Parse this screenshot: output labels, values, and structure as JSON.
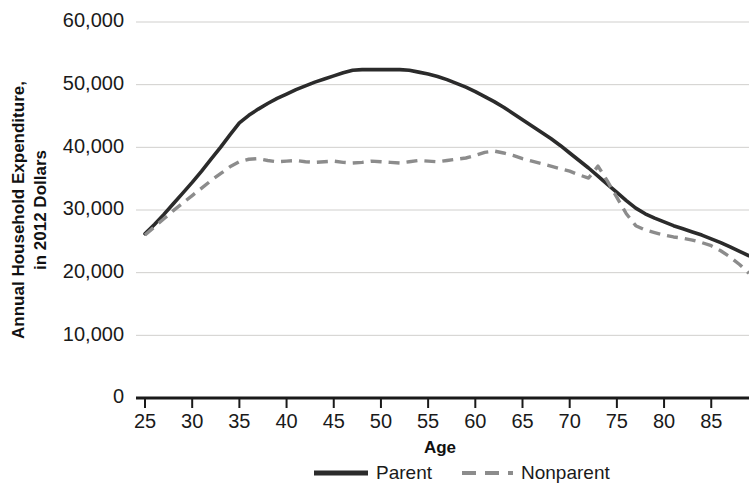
{
  "chart_data": {
    "type": "line",
    "title": "",
    "xlabel": "Age",
    "ylabel": "Annual Household Expenditure, in 2012 Dollars",
    "xlim": [
      25,
      89
    ],
    "ylim": [
      0,
      62000
    ],
    "grid": true,
    "legend_position": "bottom",
    "xticks": [
      25,
      30,
      35,
      40,
      45,
      50,
      55,
      60,
      65,
      70,
      75,
      80,
      85
    ],
    "xtick_labels": [
      "25",
      "30",
      "35",
      "40",
      "45",
      "50",
      "55",
      "60",
      "65",
      "70",
      "75",
      "80",
      "85"
    ],
    "yticks": [
      0,
      10000,
      20000,
      30000,
      40000,
      50000,
      60000
    ],
    "ytick_labels": [
      "0",
      "10,000",
      "20,000",
      "30,000",
      "40,000",
      "50,000",
      "60,000"
    ],
    "x": [
      25,
      26,
      27,
      28,
      29,
      30,
      31,
      32,
      33,
      34,
      35,
      36,
      37,
      38,
      39,
      40,
      41,
      42,
      43,
      44,
      45,
      46,
      47,
      48,
      49,
      50,
      51,
      52,
      53,
      54,
      55,
      56,
      57,
      58,
      59,
      60,
      61,
      62,
      63,
      64,
      65,
      66,
      67,
      68,
      69,
      70,
      71,
      72,
      73,
      74,
      75,
      76,
      77,
      78,
      79,
      80,
      81,
      82,
      83,
      84,
      85,
      86,
      87,
      88,
      89
    ],
    "series": [
      {
        "name": "Parent",
        "color": "#2b2b2b",
        "style": "solid",
        "values": [
          26200,
          27700,
          29300,
          31000,
          32700,
          34400,
          36200,
          38100,
          40000,
          42000,
          43900,
          45100,
          46100,
          47000,
          47800,
          48500,
          49200,
          49800,
          50400,
          50900,
          51400,
          51900,
          52300,
          52400,
          52400,
          52400,
          52400,
          52400,
          52300,
          52000,
          51700,
          51300,
          50800,
          50200,
          49600,
          48900,
          48100,
          47300,
          46400,
          45400,
          44400,
          43400,
          42400,
          41400,
          40300,
          39100,
          37900,
          36700,
          35400,
          34100,
          32800,
          31500,
          30300,
          29400,
          28700,
          28100,
          27500,
          27000,
          26500,
          26000,
          25400,
          24800,
          24100,
          23400,
          22700
        ]
      },
      {
        "name": "Nonparent",
        "color": "#8c8c8c",
        "style": "dashed",
        "values": [
          26000,
          27300,
          28600,
          29900,
          31100,
          32300,
          33500,
          34700,
          35800,
          36900,
          37700,
          38100,
          38200,
          37900,
          37700,
          37800,
          37900,
          37700,
          37600,
          37700,
          37800,
          37600,
          37500,
          37600,
          37800,
          37700,
          37600,
          37500,
          37700,
          37900,
          37800,
          37700,
          37900,
          38100,
          38300,
          38700,
          39200,
          39400,
          39100,
          38700,
          38200,
          37800,
          37400,
          37000,
          36600,
          36200,
          35600,
          35100,
          37000,
          34600,
          32000,
          29400,
          27500,
          26800,
          26400,
          26000,
          25700,
          25500,
          25200,
          24800,
          24300,
          23500,
          22500,
          21300,
          19900
        ]
      }
    ]
  },
  "axis_titles": {
    "x": "Age",
    "y_line1": "Annual Household Expenditure,",
    "y_line2": "in 2012 Dollars"
  },
  "legend": {
    "items": [
      {
        "label": "Parent",
        "color": "#2b2b2b",
        "style": "solid"
      },
      {
        "label": "Nonparent",
        "color": "#8c8c8c",
        "style": "dashed"
      }
    ]
  }
}
